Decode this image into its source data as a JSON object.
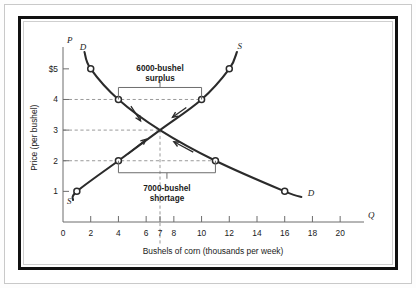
{
  "figure": {
    "frame_style": "double-ruled black box",
    "background": "#ffffff"
  },
  "chart_data": {
    "type": "line",
    "title": "",
    "xlabel": "Bushels of corn (thousands per week)",
    "ylabel": "Price (per bushel)",
    "x_axis_variable": "Q",
    "y_axis_variable": "P",
    "xlim": [
      0,
      21
    ],
    "ylim": [
      0,
      5.8
    ],
    "grid": false,
    "legend": "inline curve labels",
    "xticks": [
      0,
      2,
      4,
      6,
      7,
      8,
      10,
      12,
      14,
      16,
      18,
      20
    ],
    "xticklabels": [
      "0",
      "2",
      "4",
      "6",
      "7",
      "8",
      "10",
      "12",
      "14",
      "16",
      "18",
      "20"
    ],
    "yticks": [
      1,
      2,
      3,
      4,
      5
    ],
    "yticklabels": [
      "1",
      "2",
      "3",
      "4",
      "$5"
    ],
    "series": [
      {
        "name": "D",
        "label": "D",
        "type": "demand",
        "x": [
          1.55,
          2,
          4,
          7,
          11,
          16,
          17.2
        ],
        "y": [
          5.55,
          5,
          4,
          3,
          2,
          1,
          0.82
        ],
        "markers": [
          {
            "x": 2,
            "y": 5
          },
          {
            "x": 4,
            "y": 4
          },
          {
            "x": 11,
            "y": 2
          },
          {
            "x": 16,
            "y": 1
          }
        ],
        "label_positions": [
          {
            "x": 1.45,
            "y": 5.62,
            "text": "D"
          },
          {
            "x": 17.9,
            "y": 0.85,
            "text": "D"
          }
        ]
      },
      {
        "name": "S",
        "label": "S",
        "type": "supply",
        "x": [
          0.72,
          1,
          4,
          7,
          10,
          12,
          12.55
        ],
        "y": [
          0.72,
          1,
          2,
          3,
          4,
          5,
          5.55
        ],
        "markers": [
          {
            "x": 1,
            "y": 1
          },
          {
            "x": 4,
            "y": 2
          },
          {
            "x": 10,
            "y": 4
          },
          {
            "x": 12,
            "y": 5
          }
        ],
        "label_positions": [
          {
            "x": 0.45,
            "y": 0.58,
            "text": "S"
          },
          {
            "x": 12.75,
            "y": 5.65,
            "text": "S"
          }
        ]
      }
    ],
    "equilibrium": {
      "x": 7,
      "y": 3,
      "price": 3,
      "quantity": 7
    },
    "annotations": [
      {
        "id": "surplus",
        "line1": "6000-bushel",
        "line2": "surplus",
        "price": 4,
        "from_x": 4,
        "to_x": 10,
        "amount": 6000
      },
      {
        "id": "shortage",
        "line1": "7000-bushel",
        "line2": "shortage",
        "price": 2,
        "from_x": 4,
        "to_x": 11,
        "amount": 7000
      }
    ],
    "reference_lines": [
      {
        "price": 4,
        "x_end": 10,
        "style": "dashed"
      },
      {
        "price": 3,
        "x_end": 7,
        "style": "dashed"
      },
      {
        "price": 2,
        "x_end": 11,
        "style": "dashed"
      },
      {
        "vertical_at_x": 7,
        "style": "dashed"
      }
    ],
    "colors": {
      "curve": "#2b2b2b",
      "axis": "#6d6d6d",
      "dashed": "#9a9a9a",
      "text": "#1a1a1a"
    }
  }
}
